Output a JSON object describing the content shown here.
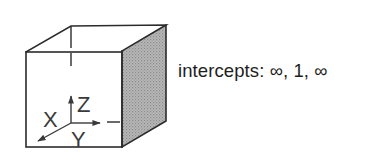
{
  "figure": {
    "type": "unit-cell-plane-diagram",
    "caption": "intercepts: ∞, 1, ∞",
    "intercepts": {
      "x": "∞",
      "y": "1",
      "z": "∞"
    },
    "axes": {
      "x_label": "X",
      "y_label": "Y",
      "z_label": "Z"
    },
    "shaded_face": "right face (y = 1 plane)",
    "colors": {
      "line": "#2b2b2b",
      "shade": "#a9a9a9",
      "text": "#1e1e1e",
      "background": "#ffffff"
    }
  }
}
